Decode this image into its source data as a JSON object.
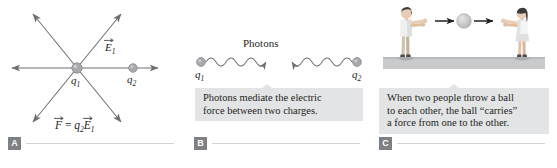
{
  "figure": {
    "panels": [
      {
        "id": "A",
        "badge": "A",
        "name": "electric-field-force-diagram",
        "labels": {
          "field_vector": "E",
          "field_vector_sub": "1",
          "charge_source": "q",
          "charge_source_sub": "1",
          "charge_test": "q",
          "charge_test_sub": "2",
          "equation_force": "F",
          "equation_equals": " = ",
          "equation_charge": "q",
          "equation_charge_sub": "2",
          "equation_field": "E",
          "equation_field_sub": "1"
        }
      },
      {
        "id": "B",
        "badge": "B",
        "name": "photon-exchange-diagram",
        "title": "Photons",
        "labels": {
          "charge_left": "q",
          "charge_left_sub": "1",
          "charge_right": "q",
          "charge_right_sub": "2"
        },
        "caption": {
          "line1": "Photons mediate the electric",
          "line2": "force between two charges."
        }
      },
      {
        "id": "C",
        "badge": "C",
        "name": "ball-throw-analogy-diagram",
        "caption": {
          "line1": "When two people throw a ball",
          "line2": "to each other, the ball “carries”",
          "line3": "a force from one to the other."
        }
      }
    ],
    "colors": {
      "ink": "#231f20",
      "arrow_gray": "#6d6e71",
      "charge_gray": "#a7a9ac",
      "callout_bg": "#e3e4e6",
      "badge_bg": "#7f8083",
      "rule_gray": "#d2d3d5",
      "ground_gray": "#c9cacc",
      "skin": "#e8cdb4",
      "shirt": "#efefef",
      "pants_boy": "#cfc2ae",
      "skirt_girl": "#e0e0e0",
      "hair": "#3b3b3b",
      "ball_gray": "#bcbec0"
    }
  }
}
